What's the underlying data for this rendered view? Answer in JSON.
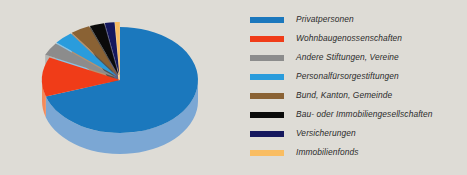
{
  "background_color": "#dedcd6",
  "text_color": "#2b2b2b",
  "chart_data": {
    "type": "pie",
    "title": "",
    "subtitle": "",
    "xlabel": "",
    "ylabel": "",
    "grid": false,
    "legend_position": "right",
    "three_d": true,
    "categories": [
      "Privatpersonen",
      "Wohnbaugenossenschaften",
      "Andere Stiftungen, Vereine",
      "Personalfürsorgestiftungen",
      "Bund, Kanton, Gemeinde",
      "Bau- oder Immobiliengesellschaften",
      "Versicherungen",
      "Immobilienfonds"
    ],
    "values": [
      70,
      12,
      4,
      4,
      4,
      3,
      2,
      1
    ],
    "colors": [
      "#1b78bd",
      "#f03c18",
      "#8c8c8c",
      "#2a9cdc",
      "#8a6234",
      "#0a0a0a",
      "#15185e",
      "#f9bd62"
    ],
    "side_colors": [
      "#7ba7d4",
      "#f58a5a",
      "#b5b5b2",
      "#8cc3e4",
      "#b49272",
      "#555553",
      "#5d5f82",
      "#fcd79c"
    ]
  },
  "legend": {
    "items": [
      {
        "label": "Privatpersonen",
        "color": "#1b78bd"
      },
      {
        "label": "Wohnbaugenossenschaften",
        "color": "#f03c18"
      },
      {
        "label": "Andere Stiftungen, Vereine",
        "color": "#8c8c8c"
      },
      {
        "label": "Personalfürsorgestiftungen",
        "color": "#2a9cdc"
      },
      {
        "label": "Bund, Kanton, Gemeinde",
        "color": "#8a6234"
      },
      {
        "label": "Bau- oder Immobiliengesellschaften",
        "color": "#0a0a0a"
      },
      {
        "label": "Versicherungen",
        "color": "#15185e"
      },
      {
        "label": "Immobilienfonds",
        "color": "#f9bd62"
      }
    ]
  }
}
